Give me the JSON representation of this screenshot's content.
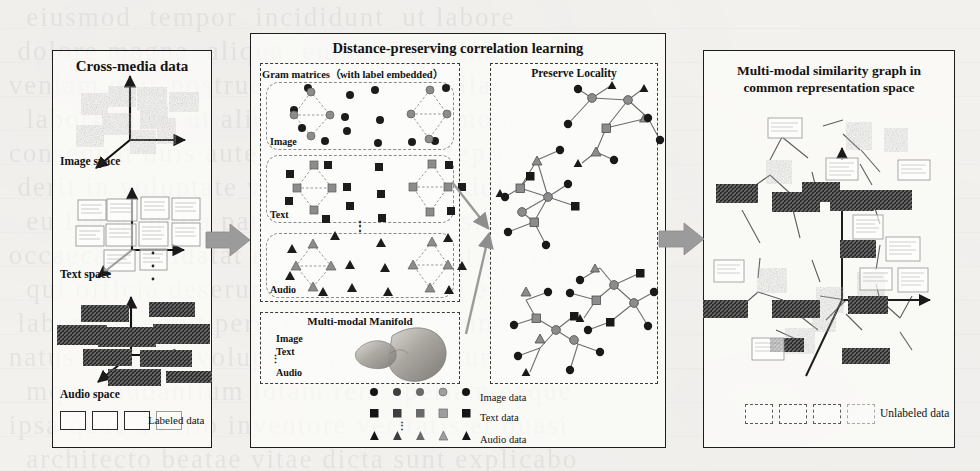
{
  "figure": {
    "background_color": "#f2f1ee",
    "ink_color": "#131313",
    "arrow_color": "#9a9a9a"
  },
  "left_panel": {
    "title": "Cross-media data",
    "spaces": [
      {
        "label": "Image space"
      },
      {
        "label": "Text space"
      },
      {
        "label": "Audio space"
      }
    ],
    "legend": {
      "label": "Labeled data",
      "swatch_count": 4,
      "swatch_style": "solid-box"
    }
  },
  "middle_panel": {
    "title": "Distance-preserving correlation learning",
    "gram": {
      "title": "Gram matrices（with label embedded）",
      "rows": [
        {
          "label": "Image",
          "marker": "circle"
        },
        {
          "label": "Text",
          "marker": "square"
        },
        {
          "label": "Audio",
          "marker": "triangle"
        }
      ],
      "row_separator": "⋮"
    },
    "manifold": {
      "title": "Multi-modal Manifold",
      "modalities": [
        "Image",
        "Text",
        "Audio"
      ],
      "separator": "⋮"
    },
    "locality": {
      "title": "Preserve Locality"
    },
    "legend": [
      {
        "label": "Image data",
        "marker": "circle",
        "count": 5
      },
      {
        "label": "Text data",
        "marker": "square",
        "count": 5
      },
      {
        "label": "Audio data",
        "marker": "triangle",
        "count": 5
      }
    ],
    "legend_separator": "⋮"
  },
  "right_panel": {
    "title_line1": "Multi-modal similarity graph in",
    "title_line2": "common representation space",
    "legend": {
      "label": "Unlabeled data",
      "swatch_count": 4,
      "swatch_style": "dashed-box"
    }
  },
  "flow_arrows": [
    {
      "name": "left-to-middle"
    },
    {
      "name": "middle-to-right"
    },
    {
      "name": "gram-to-locality"
    },
    {
      "name": "manifold-to-locality"
    }
  ]
}
